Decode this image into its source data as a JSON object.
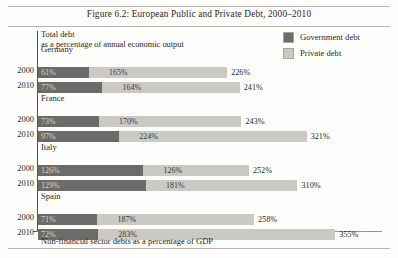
{
  "figure": {
    "title": "Figure 6.2: European Public and Private Debt, 2000–2010",
    "subtitle_line1": "Total debt",
    "subtitle_line2": "as a percentage of annual economic output",
    "footnote": "Non-financial sector debts as a percentage of GDP"
  },
  "legend": {
    "items": [
      {
        "label": "Government debt",
        "color": "#6b6b68"
      },
      {
        "label": "Private debt",
        "color": "#cac9c4"
      }
    ]
  },
  "chart_data": {
    "type": "bar",
    "orientation": "horizontal",
    "stacked": true,
    "title": "Figure 6.2: European Public and Private Debt, 2000–2010",
    "subtitle": "Total debt as a percentage of annual economic output",
    "xlabel": "Non-financial sector debts as a percentage of GDP",
    "ylabel": "",
    "grid": false,
    "legend_position": "top-right",
    "xlim": [
      0,
      355
    ],
    "unit": "%",
    "categories": [
      "Germany 2000",
      "Germany 2010",
      "France 2000",
      "France 2010",
      "Italy 2000",
      "Italy 2010",
      "Spain 2000",
      "Spain 2010"
    ],
    "series": [
      {
        "name": "Government debt",
        "color": "#6b6b68",
        "values": [
          61,
          77,
          73,
          97,
          126,
          129,
          71,
          72
        ]
      },
      {
        "name": "Private debt",
        "color": "#cac9c4",
        "values": [
          165,
          164,
          170,
          224,
          126,
          181,
          187,
          283
        ]
      }
    ],
    "totals": [
      226,
      241,
      243,
      321,
      252,
      310,
      258,
      355
    ],
    "groups": [
      {
        "name": "Germany",
        "rows": [
          {
            "year": "2000",
            "government": "61%",
            "private": "165%",
            "total": "226%",
            "government_value": 61,
            "private_value": 165,
            "total_value": 226
          },
          {
            "year": "2010",
            "government": "77%",
            "private": "164%",
            "total": "241%",
            "government_value": 77,
            "private_value": 164,
            "total_value": 241
          }
        ]
      },
      {
        "name": "France",
        "rows": [
          {
            "year": "2000",
            "government": "73%",
            "private": "170%",
            "total": "243%",
            "government_value": 73,
            "private_value": 170,
            "total_value": 243
          },
          {
            "year": "2010",
            "government": "97%",
            "private": "224%",
            "total": "321%",
            "government_value": 97,
            "private_value": 224,
            "total_value": 321
          }
        ]
      },
      {
        "name": "Italy",
        "rows": [
          {
            "year": "2000",
            "government": "126%",
            "private": "126%",
            "total": "252%",
            "government_value": 126,
            "private_value": 126,
            "total_value": 252
          },
          {
            "year": "2010",
            "government": "129%",
            "private": "181%",
            "total": "310%",
            "government_value": 129,
            "private_value": 181,
            "total_value": 310
          }
        ]
      },
      {
        "name": "Spain",
        "rows": [
          {
            "year": "2000",
            "government": "71%",
            "private": "187%",
            "total": "258%",
            "government_value": 71,
            "private_value": 187,
            "total_value": 258
          },
          {
            "year": "2010",
            "government": "72%",
            "private": "283%",
            "total": "355%",
            "government_value": 72,
            "private_value": 283,
            "total_value": 355
          }
        ]
      }
    ]
  }
}
